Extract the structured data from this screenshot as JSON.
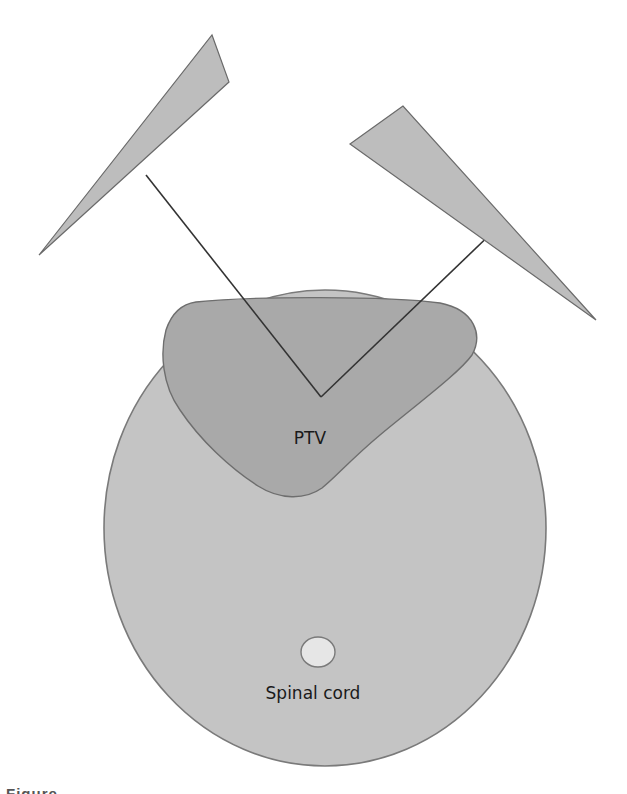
{
  "diagram": {
    "type": "radiotherapy-beam-arrangement",
    "labels": {
      "ptv": "PTV",
      "spinal_cord": "Spinal cord"
    },
    "beams": [
      {
        "name": "left-oblique-beam",
        "side": "left"
      },
      {
        "name": "right-oblique-beam",
        "side": "right"
      }
    ],
    "structures": [
      {
        "name": "body-outline"
      },
      {
        "name": "ptv",
        "label": "PTV"
      },
      {
        "name": "spinal-cord",
        "label": "Spinal cord"
      }
    ],
    "colors": {
      "background": "#ffffff",
      "body_fill": "#c4c4c4",
      "body_stroke": "#7a7a7a",
      "ptv_fill": "#a9a9a9",
      "ptv_stroke": "#6e6e6e",
      "cord_fill": "#e6e6e6",
      "beam_fill": "#bdbdbd",
      "beam_stroke": "#6a6a6a",
      "beam_line": "#333333",
      "text": "#1a1a1a"
    }
  },
  "caption": {
    "text": "Figure"
  }
}
